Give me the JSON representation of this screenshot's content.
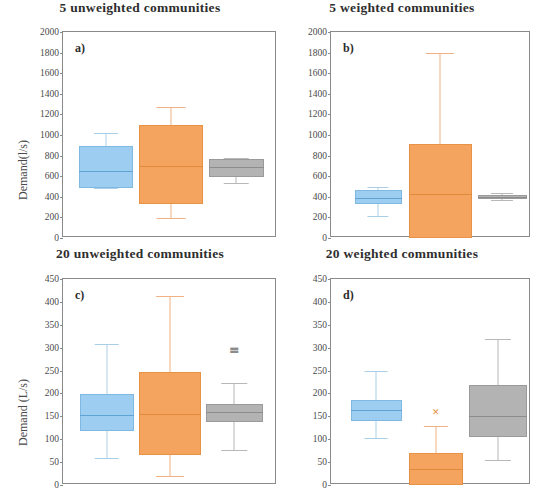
{
  "figure": {
    "axis_label_top": "Demand(l/s)",
    "axis_label_bottom": "Demand (L/s)"
  },
  "chart_data": [
    {
      "type": "box",
      "panel": "a)",
      "title": "5 unweighted communities",
      "ylabel": "Demand(l/s)",
      "xlabel": "",
      "ylim": [
        0,
        2000
      ],
      "yticks": [
        0,
        200,
        400,
        600,
        800,
        1000,
        1200,
        1400,
        1600,
        1800,
        2000
      ],
      "grid": false,
      "series": [
        {
          "name": "blue",
          "color": "#9dcdf0",
          "whisker_low": 490,
          "q1": 490,
          "median": 655,
          "q3": 890,
          "whisker_high": 1020,
          "outliers": []
        },
        {
          "name": "orange",
          "color": "#f5a460",
          "whisker_low": 190,
          "q1": 330,
          "median": 700,
          "q3": 1100,
          "whisker_high": 1270,
          "outliers": []
        },
        {
          "name": "gray",
          "color": "#b3b3b3",
          "whisker_low": 530,
          "q1": 590,
          "median": 690,
          "q3": 770,
          "whisker_high": 780,
          "outliers": []
        }
      ]
    },
    {
      "type": "box",
      "panel": "b)",
      "title": "5 weighted communities",
      "ylabel": "",
      "xlabel": "",
      "ylim": [
        0,
        2000
      ],
      "yticks": [
        0,
        200,
        400,
        600,
        800,
        1000,
        1200,
        1400,
        1600,
        1800,
        2000
      ],
      "grid": false,
      "series": [
        {
          "name": "blue",
          "color": "#9dcdf0",
          "whisker_low": 215,
          "q1": 330,
          "median": 390,
          "q3": 465,
          "whisker_high": 500,
          "outliers": []
        },
        {
          "name": "orange",
          "color": "#f5a460",
          "whisker_low": 0,
          "q1": 0,
          "median": 430,
          "q3": 915,
          "whisker_high": 1800,
          "outliers": []
        },
        {
          "name": "gray",
          "color": "#b3b3b3",
          "whisker_low": 365,
          "q1": 375,
          "median": 395,
          "q3": 415,
          "whisker_high": 440,
          "outliers": []
        }
      ]
    },
    {
      "type": "box",
      "panel": "c)",
      "title": "20 unweighted communities",
      "ylabel": "Demand (L/s)",
      "xlabel": "",
      "ylim": [
        0,
        450
      ],
      "yticks": [
        0,
        50,
        100,
        150,
        200,
        250,
        300,
        350,
        400,
        450
      ],
      "grid": false,
      "series": [
        {
          "name": "blue",
          "color": "#9dcdf0",
          "whisker_low": 58,
          "q1": 118,
          "median": 153,
          "q3": 199,
          "whisker_high": 308,
          "outliers": []
        },
        {
          "name": "orange",
          "color": "#f5a460",
          "whisker_low": 20,
          "q1": 65,
          "median": 155,
          "q3": 247,
          "whisker_high": 412,
          "outliers": []
        },
        {
          "name": "gray",
          "color": "#b3b3b3",
          "whisker_low": 76,
          "q1": 138,
          "median": 160,
          "q3": 177,
          "whisker_high": 223,
          "outliers": [
            293,
            299
          ]
        }
      ]
    },
    {
      "type": "box",
      "panel": "d)",
      "title": "20 weighted communities",
      "ylabel": "",
      "xlabel": "",
      "ylim": [
        0,
        450
      ],
      "yticks": [
        0,
        50,
        100,
        150,
        200,
        250,
        300,
        350,
        400,
        450
      ],
      "grid": false,
      "series": [
        {
          "name": "blue",
          "color": "#9dcdf0",
          "whisker_low": 103,
          "q1": 140,
          "median": 163,
          "q3": 186,
          "whisker_high": 249,
          "outliers": []
        },
        {
          "name": "orange",
          "color": "#f5a460",
          "whisker_low": 0,
          "q1": 0,
          "median": 35,
          "q3": 70,
          "whisker_high": 128,
          "outliers": [
            160
          ]
        },
        {
          "name": "gray",
          "color": "#b3b3b3",
          "whisker_low": 54,
          "q1": 104,
          "median": 150,
          "q3": 219,
          "whisker_high": 320,
          "outliers": []
        }
      ]
    }
  ]
}
